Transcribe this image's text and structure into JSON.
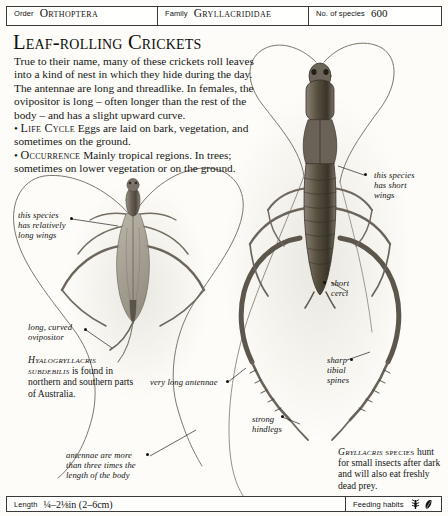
{
  "header": {
    "order_label": "Order",
    "order_value": "Orthoptera",
    "family_label": "Family",
    "family_value": "Gryllacrididae",
    "species_label": "No. of species",
    "species_value": "600"
  },
  "footer": {
    "length_label": "Length",
    "length_value": "¼–2⅛in (2–6cm)",
    "feeding_label": "Feeding habits",
    "feeding_icons": [
      "insect-prey-icon",
      "leaf-icon"
    ]
  },
  "main": {
    "title": "Leaf-rolling Crickets",
    "paragraph_1": "True to their name, many of these crickets roll leaves into a kind of nest in which they hide during the day. The antennae are long and threadlike. In females, the ovipositor is long – often longer than the rest of the body – and has a slight upward curve.",
    "life_cycle_heading": "Life Cycle",
    "life_cycle_text": "Eggs are laid on bark, vegetation, and sometimes on the ground.",
    "occurrence_heading": "Occurrence",
    "occurrence_text": "Mainly tropical regions. In trees; sometimes on lower vegetation or on the ground."
  },
  "annotations": {
    "left_wings": "this species\nhas relatively\nlong wings",
    "ovipositor": "long, curved\novipositor",
    "antennae_long": "very long antennae",
    "antennae_length": "antennae are more\nthan three times the\nlength of the body",
    "right_wings": "this species\nhas short\nwings",
    "cerci": "short\ncerci",
    "tibial_spines": "sharp\ntibial\nspines",
    "hindlegs": "strong\nhindlegs"
  },
  "captions": {
    "left_species": "Hyalogryllacris subdebilis",
    "left_text": " is found in northern and southern parts of Australia.",
    "right_species": "Gryllacris",
    "right_species_suffix": "species",
    "right_text": "hunt for small insects after dark and will also eat freshly dead prey."
  },
  "colors": {
    "page_background": "#fdfcf8",
    "rule": "#3a3a3a",
    "text": "#161616",
    "specimen_body": "#6e655c",
    "specimen_dark": "#3d372f"
  }
}
